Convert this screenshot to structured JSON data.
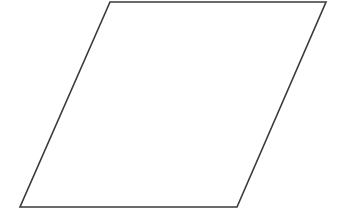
{
  "diagram": {
    "shape": "parallelogram",
    "stroke_color": "#3a3a3a",
    "fill_color": "#ffffff",
    "background": "#ffffff",
    "stroke_width": 1.6,
    "vertices": {
      "top_left": [
        110,
        2
      ],
      "top_right": [
        326,
        2
      ],
      "bottom_right": [
        237,
        207
      ],
      "bottom_left": [
        20,
        207
      ]
    },
    "points": "110,2 326,2 237,207 20,207"
  }
}
